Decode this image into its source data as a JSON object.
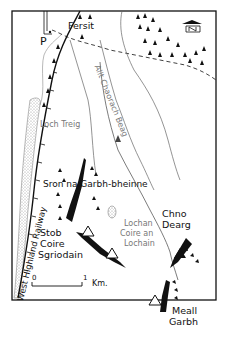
{
  "map": {
    "type": "sketch-route-map",
    "colors": {
      "ink": "#111111",
      "faint": "#888888",
      "water_stipple": "#bbbbbb",
      "background": "#ffffff"
    },
    "places": {
      "fersit": "Fersit",
      "parking": "P",
      "loch_treig": "Loch Treig",
      "allt_coire": "Allt Chaorach Beag",
      "sron": "Sron na Garbh-bheinne",
      "lochan_1": "Lochan",
      "lochan_2": "Coire an",
      "lochan_3": "Lochain",
      "chno_1": "Chno",
      "chno_2": "Dearg",
      "stob_1": "Stob",
      "stob_2": "Coire",
      "stob_3": "Sgriodain",
      "meall_1": "Meall",
      "meall_2": "Garbh",
      "railway": "West Highland Railway"
    },
    "scale": {
      "start": "0",
      "end": "1",
      "unit": "Km."
    },
    "north_arrow": "N"
  }
}
